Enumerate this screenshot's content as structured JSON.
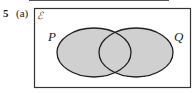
{
  "question": {
    "number": "5",
    "part": "(a)"
  },
  "diagram": {
    "universal_symbol": "ℰ",
    "sets": [
      {
        "label": "P"
      },
      {
        "label": "Q"
      }
    ],
    "shaded_region": "P ∪ Q",
    "colors": {
      "fill": "#d0d0d0",
      "stroke": "#222222",
      "border": "#333333"
    }
  }
}
